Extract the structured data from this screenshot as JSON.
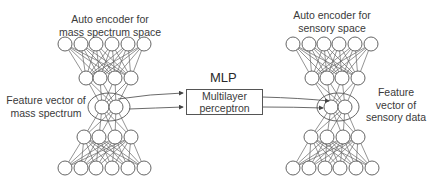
{
  "left_network": {
    "title_line1": "Auto encoder for",
    "title_line2": "mass spectrum space",
    "feature_label_line1": "Feature vector of",
    "feature_label_line2": "mass spectrum",
    "layers": [
      6,
      4,
      2,
      4,
      6
    ]
  },
  "right_network": {
    "title_line1": "Auto encoder for",
    "title_line2": "sensory space",
    "feature_label_line1": "Feature",
    "feature_label_line2": "vector of",
    "feature_label_line3": "sensory data",
    "layers": [
      6,
      4,
      2,
      4,
      6
    ]
  },
  "mlp": {
    "title": "MLP",
    "box_line1": "Multilayer",
    "box_line2": "perceptron"
  },
  "colors": {
    "stroke": "#555555",
    "text": "#3a3a3a",
    "background": "#ffffff"
  }
}
